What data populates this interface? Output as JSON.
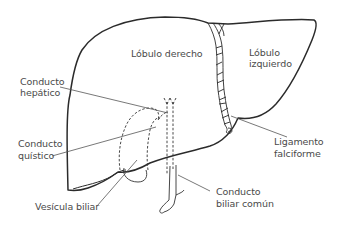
{
  "diagram": {
    "colors": {
      "outline": "#2b2b2b",
      "leader_line": "#555555",
      "text": "#4a4a4a",
      "background": "#ffffff"
    },
    "labels": {
      "lobulo_derecho": "Lóbulo derecho",
      "lobulo_izquierdo_1": "Lóbulo",
      "lobulo_izquierdo_2": "izquierdo",
      "conducto_hepatico_1": "Conducto",
      "conducto_hepatico_2": "hepático",
      "conducto_quistico_1": "Conducto",
      "conducto_quistico_2": "quístico",
      "ligamento_falciforme_1": "Ligamento",
      "ligamento_falciforme_2": "falciforme",
      "vesicula_biliar": "Vesícula biliar",
      "conducto_biliar_comun_1": "Conducto",
      "conducto_biliar_comun_2": "biliar común"
    }
  }
}
